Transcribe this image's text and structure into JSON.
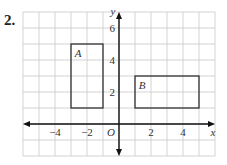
{
  "problem_number": "2.",
  "grid": {
    "x_min": -6,
    "x_max": 6,
    "y_min": -2,
    "y_max": 7,
    "cell_px": 16,
    "origin_px": [
      119,
      124
    ]
  },
  "axes": {
    "x_label": "x",
    "y_label": "y",
    "origin_label": "O",
    "x_ticks": [
      {
        "v": -4,
        "label": "−4"
      },
      {
        "v": -2,
        "label": "−2"
      },
      {
        "v": 2,
        "label": "2"
      },
      {
        "v": 4,
        "label": "4"
      }
    ],
    "y_ticks": [
      {
        "v": 2,
        "label": "2"
      },
      {
        "v": 4,
        "label": "4"
      },
      {
        "v": 6,
        "label": "6"
      }
    ]
  },
  "shapes": [
    {
      "label": "A",
      "x1": -3,
      "y1": 1,
      "x2": -1,
      "y2": 5
    },
    {
      "label": "B",
      "x1": 1,
      "y1": 1,
      "x2": 5,
      "y2": 3
    }
  ],
  "colors": {
    "grid": "#c8c8c8",
    "axis": "#111111",
    "shape": "#333333",
    "text": "#333333"
  }
}
